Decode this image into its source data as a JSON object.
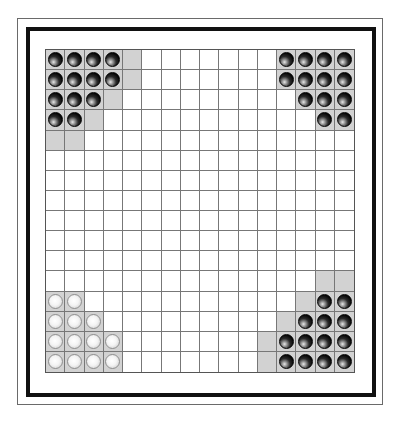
{
  "board": {
    "rows": 16,
    "cols": 16,
    "colors": {
      "board_background": "#ffffff",
      "grid_line": "#777777",
      "shaded_cell": "#d2d2d2",
      "frame": "#111111"
    },
    "pieces": [
      {
        "row": 0,
        "col": 0,
        "color": "black"
      },
      {
        "row": 0,
        "col": 1,
        "color": "black"
      },
      {
        "row": 0,
        "col": 2,
        "color": "black"
      },
      {
        "row": 0,
        "col": 3,
        "color": "black"
      },
      {
        "row": 1,
        "col": 0,
        "color": "black"
      },
      {
        "row": 1,
        "col": 1,
        "color": "black"
      },
      {
        "row": 1,
        "col": 2,
        "color": "black"
      },
      {
        "row": 1,
        "col": 3,
        "color": "black"
      },
      {
        "row": 2,
        "col": 0,
        "color": "black"
      },
      {
        "row": 2,
        "col": 1,
        "color": "black"
      },
      {
        "row": 2,
        "col": 2,
        "color": "black"
      },
      {
        "row": 3,
        "col": 0,
        "color": "black"
      },
      {
        "row": 3,
        "col": 1,
        "color": "black"
      },
      {
        "row": 0,
        "col": 12,
        "color": "black"
      },
      {
        "row": 0,
        "col": 13,
        "color": "black"
      },
      {
        "row": 0,
        "col": 14,
        "color": "black"
      },
      {
        "row": 0,
        "col": 15,
        "color": "black"
      },
      {
        "row": 1,
        "col": 12,
        "color": "black"
      },
      {
        "row": 1,
        "col": 13,
        "color": "black"
      },
      {
        "row": 1,
        "col": 14,
        "color": "black"
      },
      {
        "row": 1,
        "col": 15,
        "color": "black"
      },
      {
        "row": 2,
        "col": 13,
        "color": "black"
      },
      {
        "row": 2,
        "col": 14,
        "color": "black"
      },
      {
        "row": 2,
        "col": 15,
        "color": "black"
      },
      {
        "row": 3,
        "col": 14,
        "color": "black"
      },
      {
        "row": 3,
        "col": 15,
        "color": "black"
      },
      {
        "row": 12,
        "col": 0,
        "color": "white"
      },
      {
        "row": 12,
        "col": 1,
        "color": "white"
      },
      {
        "row": 13,
        "col": 0,
        "color": "white"
      },
      {
        "row": 13,
        "col": 1,
        "color": "white"
      },
      {
        "row": 13,
        "col": 2,
        "color": "white"
      },
      {
        "row": 14,
        "col": 0,
        "color": "white"
      },
      {
        "row": 14,
        "col": 1,
        "color": "white"
      },
      {
        "row": 14,
        "col": 2,
        "color": "white"
      },
      {
        "row": 14,
        "col": 3,
        "color": "white"
      },
      {
        "row": 15,
        "col": 0,
        "color": "white"
      },
      {
        "row": 15,
        "col": 1,
        "color": "white"
      },
      {
        "row": 15,
        "col": 2,
        "color": "white"
      },
      {
        "row": 15,
        "col": 3,
        "color": "white"
      },
      {
        "row": 12,
        "col": 14,
        "color": "black"
      },
      {
        "row": 12,
        "col": 15,
        "color": "black"
      },
      {
        "row": 13,
        "col": 13,
        "color": "black"
      },
      {
        "row": 13,
        "col": 14,
        "color": "black"
      },
      {
        "row": 13,
        "col": 15,
        "color": "black"
      },
      {
        "row": 14,
        "col": 12,
        "color": "black"
      },
      {
        "row": 14,
        "col": 13,
        "color": "black"
      },
      {
        "row": 14,
        "col": 14,
        "color": "black"
      },
      {
        "row": 14,
        "col": 15,
        "color": "black"
      },
      {
        "row": 15,
        "col": 12,
        "color": "black"
      },
      {
        "row": 15,
        "col": 13,
        "color": "black"
      },
      {
        "row": 15,
        "col": 14,
        "color": "black"
      },
      {
        "row": 15,
        "col": 15,
        "color": "black"
      }
    ],
    "shaded_cells": [
      {
        "row": 0,
        "col": 0
      },
      {
        "row": 0,
        "col": 1
      },
      {
        "row": 0,
        "col": 2
      },
      {
        "row": 0,
        "col": 3
      },
      {
        "row": 0,
        "col": 4
      },
      {
        "row": 1,
        "col": 0
      },
      {
        "row": 1,
        "col": 1
      },
      {
        "row": 1,
        "col": 2
      },
      {
        "row": 1,
        "col": 3
      },
      {
        "row": 1,
        "col": 4
      },
      {
        "row": 2,
        "col": 0
      },
      {
        "row": 2,
        "col": 1
      },
      {
        "row": 2,
        "col": 2
      },
      {
        "row": 2,
        "col": 3
      },
      {
        "row": 3,
        "col": 0
      },
      {
        "row": 3,
        "col": 1
      },
      {
        "row": 3,
        "col": 2
      },
      {
        "row": 4,
        "col": 0
      },
      {
        "row": 4,
        "col": 1
      },
      {
        "row": 0,
        "col": 12
      },
      {
        "row": 0,
        "col": 13
      },
      {
        "row": 0,
        "col": 14
      },
      {
        "row": 0,
        "col": 15
      },
      {
        "row": 1,
        "col": 12
      },
      {
        "row": 1,
        "col": 13
      },
      {
        "row": 1,
        "col": 14
      },
      {
        "row": 1,
        "col": 15
      },
      {
        "row": 2,
        "col": 13
      },
      {
        "row": 2,
        "col": 14
      },
      {
        "row": 2,
        "col": 15
      },
      {
        "row": 3,
        "col": 14
      },
      {
        "row": 3,
        "col": 15
      },
      {
        "row": 12,
        "col": 0
      },
      {
        "row": 12,
        "col": 1
      },
      {
        "row": 13,
        "col": 0
      },
      {
        "row": 13,
        "col": 1
      },
      {
        "row": 13,
        "col": 2
      },
      {
        "row": 14,
        "col": 0
      },
      {
        "row": 14,
        "col": 1
      },
      {
        "row": 14,
        "col": 2
      },
      {
        "row": 14,
        "col": 3
      },
      {
        "row": 15,
        "col": 0
      },
      {
        "row": 15,
        "col": 1
      },
      {
        "row": 15,
        "col": 2
      },
      {
        "row": 15,
        "col": 3
      },
      {
        "row": 11,
        "col": 14
      },
      {
        "row": 11,
        "col": 15
      },
      {
        "row": 12,
        "col": 13
      },
      {
        "row": 12,
        "col": 14
      },
      {
        "row": 12,
        "col": 15
      },
      {
        "row": 13,
        "col": 12
      },
      {
        "row": 13,
        "col": 13
      },
      {
        "row": 13,
        "col": 14
      },
      {
        "row": 13,
        "col": 15
      },
      {
        "row": 14,
        "col": 11
      },
      {
        "row": 14,
        "col": 12
      },
      {
        "row": 14,
        "col": 13
      },
      {
        "row": 14,
        "col": 14
      },
      {
        "row": 14,
        "col": 15
      },
      {
        "row": 15,
        "col": 11
      },
      {
        "row": 15,
        "col": 12
      },
      {
        "row": 15,
        "col": 13
      },
      {
        "row": 15,
        "col": 14
      },
      {
        "row": 15,
        "col": 15
      }
    ]
  }
}
